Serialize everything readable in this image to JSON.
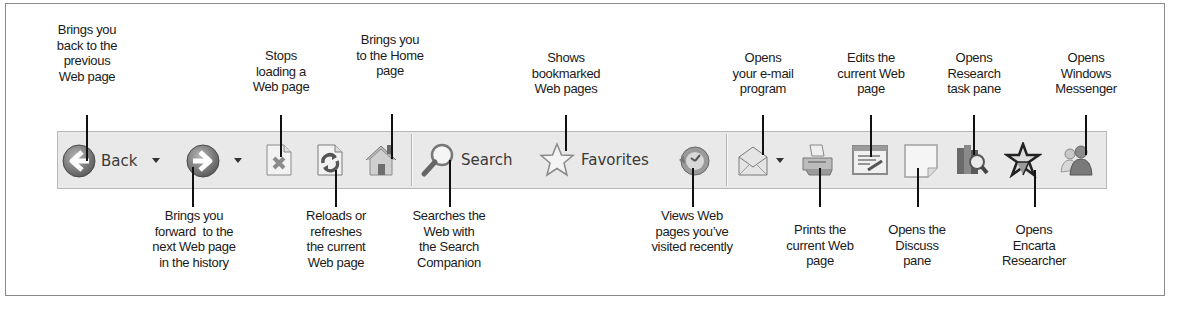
{
  "toolbar": {
    "back_label": "Back",
    "search_label": "Search",
    "favorites_label": "Favorites",
    "buttons": [
      {
        "id": "back",
        "icon": "back-arrow-icon",
        "label": "Back",
        "has_dropdown": true
      },
      {
        "id": "forward",
        "icon": "forward-arrow-icon",
        "has_dropdown": true
      },
      {
        "id": "stop",
        "icon": "stop-icon"
      },
      {
        "id": "refresh",
        "icon": "refresh-icon"
      },
      {
        "id": "home",
        "icon": "home-icon"
      },
      {
        "id": "search",
        "icon": "search-magnifier-icon",
        "label": "Search"
      },
      {
        "id": "favorites",
        "icon": "favorites-star-icon",
        "label": "Favorites"
      },
      {
        "id": "history",
        "icon": "history-icon"
      },
      {
        "id": "mail",
        "icon": "mail-envelope-icon",
        "has_dropdown": true
      },
      {
        "id": "print",
        "icon": "printer-icon"
      },
      {
        "id": "edit",
        "icon": "edit-page-icon"
      },
      {
        "id": "discuss",
        "icon": "discuss-note-icon"
      },
      {
        "id": "research",
        "icon": "research-books-icon"
      },
      {
        "id": "encarta",
        "icon": "encarta-icon"
      },
      {
        "id": "messenger",
        "icon": "messenger-buddies-icon"
      }
    ]
  },
  "callouts_top": {
    "back": "Brings you\nback to the\nprevious\nWeb page",
    "stop": "Stops\nloading a\nWeb page",
    "home": "Brings you\nto the Home\npage",
    "favorites": "Shows\nbookmarked\nWeb pages",
    "mail": "Opens\nyour e-mail\nprogram",
    "edit": "Edits the\ncurrent Web\npage",
    "research": "Opens\nResearch\ntask pane",
    "messenger": "Opens\nWindows\nMessenger"
  },
  "callouts_bottom": {
    "forward": "Brings you\nforward  to the\nnext Web page\nin the history",
    "refresh": "Reloads or\nrefreshes\nthe current\nWeb page",
    "search": "Searches the\nWeb with\nthe Search\nCompanion",
    "history": "Views Web\npages you’ve\nvisited recently",
    "print": "Prints the\ncurrent Web\npage",
    "discuss": "Opens the\nDiscuss\npane",
    "encarta": "Opens\nEncarta\nResearcher"
  },
  "colors": {
    "toolbar_bg": "#e9e9e9",
    "toolbar_border": "#b8b8b8",
    "frame_border": "#8a8a8a",
    "leader": "#111111"
  }
}
